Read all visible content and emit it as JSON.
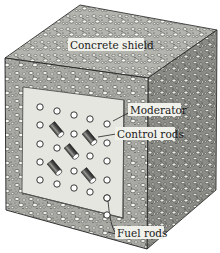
{
  "diagram": {
    "labels": {
      "concrete_shield": "Concrete shield",
      "moderator": "Moderator",
      "control_rods": "Control rods",
      "fuel_rods": "Fuel rods"
    },
    "colors": {
      "concrete_base": "#bdbdb8",
      "concrete_dark": "#4a4a46",
      "concrete_light": "#f4f4ef",
      "moderator_panel": "#e4e4df",
      "outline": "#222222",
      "rod": "#555555"
    },
    "fuel_rod_grid": {
      "rows": 6,
      "cols": 5
    },
    "control_rod_count": 5
  }
}
